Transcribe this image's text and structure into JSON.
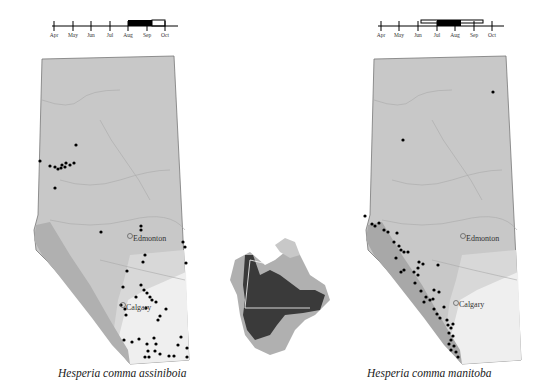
{
  "figure": {
    "left": {
      "species_label": "Hesperia comma assiniboia",
      "timeline": {
        "months": [
          "Apr",
          "May",
          "Jun",
          "Jul",
          "Aug",
          "Sep",
          "Oct"
        ],
        "solid_bar": {
          "start": "Aug",
          "end": "mid-Sep"
        },
        "open_bar": {
          "start": "mid-Sep",
          "end": "Oct"
        }
      },
      "cities": [
        {
          "name": "Edmonton"
        },
        {
          "name": "Calgary"
        }
      ]
    },
    "right": {
      "species_label": "Hesperia comma manitoba",
      "timeline": {
        "months": [
          "Apr",
          "May",
          "Jun",
          "Jul",
          "Aug",
          "Sep",
          "Oct"
        ],
        "solid_bar": {
          "start": "Jul",
          "end": "mid-Aug"
        },
        "open_bar": {
          "start": "mid-Jun",
          "end": "late-Sep"
        }
      },
      "cities": [
        {
          "name": "Edmonton"
        },
        {
          "name": "Calgary"
        }
      ]
    },
    "inset": {
      "name": "North America range map"
    },
    "colors": {
      "boreal": "#c8c8c8",
      "parkland": "#d8d8d8",
      "grassland": "#efefef",
      "foothills": "#b8b8b8",
      "mountains": "#a0a0a0",
      "range_dark": "#3a3a3a",
      "range_light": "#a8a8a8",
      "dots": "#000000"
    }
  }
}
